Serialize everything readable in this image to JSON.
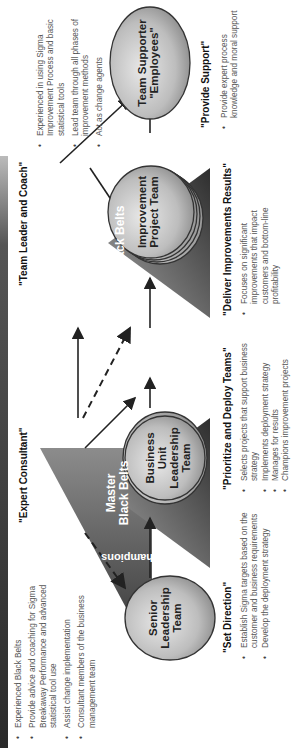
{
  "diagram": {
    "roles": {
      "senior_leadership": "Senior Leadership Team",
      "business_unit": "Business Unit Leadership Team",
      "improvement_project": "Improvement Project Team",
      "team_supporter_line1": "Team Supporter",
      "team_supporter_line2": "\"Employees\""
    },
    "triangles": {
      "champions": "Champions",
      "master_black_belts_line1": "Master",
      "master_black_belts_line2": "Black Belts",
      "black_belts": "Black Belts"
    },
    "sections": [
      {
        "heading": "\"Set Direction\"",
        "bullets": [
          "Establish Sigma targets based on the customer and business requirements",
          "Develop the deployment strategy"
        ]
      },
      {
        "heading": "\"Prioritize and Deploy Teams\"",
        "bullets": [
          "Selects projects that support business strategy",
          "Implements deployment strategy",
          "Manages for results",
          "Champions improvement projects"
        ]
      },
      {
        "heading": "\"Deliver Improvements Results\"",
        "bullets": [
          "Focuses on significant improvements that impact customers and bottom-line profitability"
        ]
      },
      {
        "heading": "\"Provide Support\"",
        "bullets": [
          "Provide expert process knowledge and moral support"
        ]
      },
      {
        "heading": "\"Expert Consultant\"",
        "bullets": [
          "Experienced Black Belts",
          "Provide advice and coaching for Sigma Breakaway Performance and advanced statistical tool use",
          "Assist change implementation",
          "Consultant members of the business management team"
        ]
      },
      {
        "heading": "\"Team Leader and Coach\"",
        "bullets": [
          "Experienced in using Sigma Improvement Process and basic statistical tools",
          "Lead team through all phases of improvement methods",
          "Act as change agents"
        ]
      }
    ],
    "colors": {
      "triangle_dark": "#3a3a3a",
      "triangle_light": "#9a9a9a",
      "ellipse_light": "#dcdcdc",
      "ellipse_dark": "#8a8a8a",
      "arrow": "#222222"
    }
  }
}
